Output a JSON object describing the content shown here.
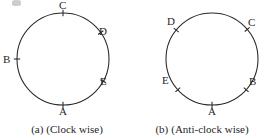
{
  "figure": {
    "panels": [
      {
        "id": "a",
        "caption_index": "(a)",
        "caption_text": "(Clock wise)",
        "circle": {
          "cx": 63,
          "cy": 59,
          "r": 46
        },
        "points": [
          {
            "label": "A",
            "angle_deg": 270,
            "label_x": 59,
            "label_y": 106
          },
          {
            "label": "B",
            "angle_deg": 180,
            "label_x": 3,
            "label_y": 54
          },
          {
            "label": "C",
            "angle_deg": 90,
            "label_x": 59,
            "label_y": 0
          },
          {
            "label": "D",
            "angle_deg": 35,
            "label_x": 99,
            "label_y": 26
          },
          {
            "label": "E",
            "angle_deg": 331,
            "label_x": 100,
            "label_y": 76
          }
        ]
      },
      {
        "id": "b",
        "caption_index": "(b)",
        "caption_text": "(Anti-clock wise)",
        "circle": {
          "cx": 77,
          "cy": 59,
          "r": 46
        },
        "points": [
          {
            "label": "A",
            "angle_deg": 270,
            "label_x": 73,
            "label_y": 106
          },
          {
            "label": "B",
            "angle_deg": 318,
            "label_x": 114,
            "label_y": 76
          },
          {
            "label": "C",
            "angle_deg": 40,
            "label_x": 113,
            "label_y": 17
          },
          {
            "label": "D",
            "angle_deg": 141,
            "label_x": 32,
            "label_y": 16
          },
          {
            "label": "E",
            "angle_deg": 222,
            "label_x": 27,
            "label_y": 75
          }
        ]
      }
    ],
    "style": {
      "stroke_color": "#262626",
      "background_color": "#ffffff",
      "text_color": "#1f1f1f"
    }
  }
}
